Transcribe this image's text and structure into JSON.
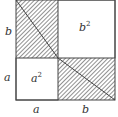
{
  "diagram": {
    "type": "geometric-proof",
    "labels": {
      "left_top": "b",
      "left_bottom": "a",
      "bottom_left": "a",
      "bottom_right": "b",
      "small_square": "a",
      "small_square_exp": "2",
      "large_square": "b",
      "large_square_exp": "2"
    },
    "colors": {
      "stroke": "#444444",
      "hatch": "#555555",
      "background": "#ffffff"
    }
  }
}
